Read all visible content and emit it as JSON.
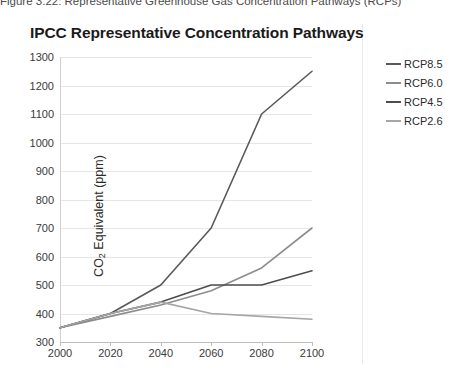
{
  "caption": {
    "text": "Figure 3.22: Representative Greenhouse Gas Concentration Pathways (RCPs)"
  },
  "chart": {
    "title": "IPCC Representative Concentration Pathways"
  },
  "legend": {
    "position": "right",
    "items": [
      {
        "label": "RCP8.5",
        "color": "#595959"
      },
      {
        "label": "RCP6.0",
        "color": "#8c8c8c"
      },
      {
        "label": "RCP4.5",
        "color": "#4d4d4d"
      },
      {
        "label": "RCP2.6",
        "color": "#a6a6a6"
      }
    ]
  },
  "chart_data": {
    "type": "line",
    "title": "IPCC Representative Concentration Pathways",
    "xlabel": "",
    "ylabel": "CO2 Equivalent (ppm)",
    "ylabel_rich": "CO₂ Equivalent (ppm)",
    "x": [
      2000,
      2020,
      2040,
      2060,
      2080,
      2100
    ],
    "xlim": [
      2000,
      2100
    ],
    "ylim": [
      300,
      1300
    ],
    "yticks": [
      300,
      400,
      500,
      600,
      700,
      800,
      900,
      1000,
      1100,
      1200,
      1300
    ],
    "xticks": [
      2000,
      2020,
      2040,
      2060,
      2080,
      2100
    ],
    "grid": true,
    "grid_axis": "y",
    "legend_position": "right",
    "series": [
      {
        "name": "RCP8.5",
        "color": "#595959",
        "values": [
          350,
          400,
          500,
          700,
          1100,
          1250
        ]
      },
      {
        "name": "RCP6.0",
        "color": "#8c8c8c",
        "values": [
          350,
          390,
          430,
          480,
          560,
          700
        ]
      },
      {
        "name": "RCP4.5",
        "color": "#4d4d4d",
        "values": [
          350,
          400,
          440,
          500,
          500,
          550
        ]
      },
      {
        "name": "RCP2.6",
        "color": "#a6a6a6",
        "values": [
          350,
          400,
          440,
          400,
          390,
          380
        ]
      }
    ]
  }
}
